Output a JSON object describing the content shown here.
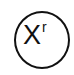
{
  "node": {
    "symbol": "X",
    "superscript": "r",
    "stroke_color": "#111111",
    "fill_color": "#ffffff"
  }
}
